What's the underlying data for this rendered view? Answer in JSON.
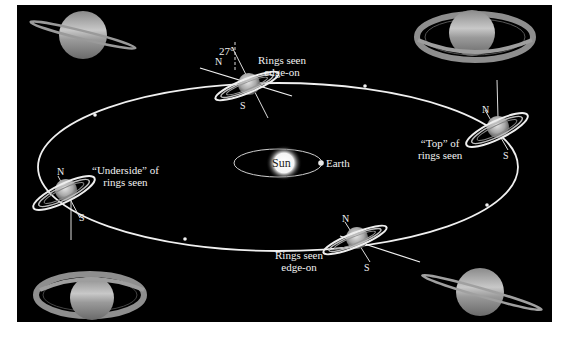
{
  "figure": {
    "background": "#000000",
    "orbit_color": "#f0f0f0",
    "labels": {
      "top_edge_on": [
        "Rings seen",
        "edge-on"
      ],
      "bottom_edge_on": [
        "Rings seen",
        "edge-on"
      ],
      "top_of_rings": [
        "“Top” of",
        "rings seen"
      ],
      "underside_of_rings": [
        "“Underside” of",
        "rings seen"
      ],
      "sun": "Sun",
      "earth": "Earth",
      "tilt_angle": "27°",
      "north": "N",
      "south": "S"
    },
    "saturn_positions": [
      {
        "position": "top",
        "view": "Rings seen edge-on"
      },
      {
        "position": "right",
        "view": "“Top” of rings seen"
      },
      {
        "position": "bottom",
        "view": "Rings seen edge-on"
      },
      {
        "position": "left",
        "view": "“Underside” of rings seen"
      }
    ],
    "corner_photos": [
      {
        "corner": "top-left",
        "view": "rings nearly edge-on, tilted"
      },
      {
        "corner": "top-right",
        "view": "rings open, viewed from above"
      },
      {
        "corner": "bottom-left",
        "view": "rings open, viewed from below"
      },
      {
        "corner": "bottom-right",
        "view": "rings nearly edge-on, tilted"
      }
    ]
  }
}
